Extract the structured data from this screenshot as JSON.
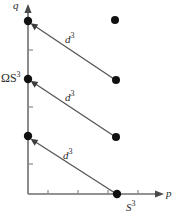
{
  "figure": {
    "axes": {
      "x_axis_label": "p",
      "y_axis_label": "q",
      "y_tick_label": "ΩS",
      "y_tick_label_sup": "3",
      "x_tick_label": "S",
      "x_tick_label_sup": "3",
      "x_axis_origin_px": [
        28,
        194
      ],
      "x_axis_end_px": [
        163,
        194
      ],
      "y_axis_end_px": [
        28,
        10
      ],
      "x_ticks_px": [
        48,
        78,
        108,
        138
      ],
      "y_ticks_px": [
        50,
        107,
        164
      ],
      "axis_color": "#6e6e6e",
      "text_color": "#2b2b2b"
    },
    "annotations": [
      {
        "label": "d",
        "sup": "3",
        "name": "arrow-label-d3-top"
      },
      {
        "label": "d",
        "sup": "3",
        "name": "arrow-label-d3-middle"
      },
      {
        "label": "d",
        "sup": "3",
        "name": "arrow-label-d3-bottom"
      }
    ],
    "points": [
      {
        "name": "point-y-axis-top",
        "x": 28,
        "y": 21,
        "on_axis": "y"
      },
      {
        "name": "point-y-axis-middle",
        "x": 28,
        "y": 79,
        "on_axis": "y"
      },
      {
        "name": "point-y-axis-bottom",
        "x": 28,
        "y": 136,
        "on_axis": "y"
      },
      {
        "name": "point-isolated-top-right",
        "x": 115,
        "y": 20,
        "on_axis": "none"
      },
      {
        "name": "point-arrow-start-top",
        "x": 116,
        "y": 80,
        "on_axis": "none"
      },
      {
        "name": "point-arrow-start-middle",
        "x": 116,
        "y": 137,
        "on_axis": "none"
      },
      {
        "name": "point-arrow-start-bottom",
        "x": 117,
        "y": 194,
        "on_axis": "x"
      }
    ],
    "arrows": [
      {
        "name": "arrow-d3-top",
        "from": [
          114,
          79
        ],
        "to": [
          31,
          23
        ]
      },
      {
        "name": "arrow-d3-middle",
        "from": [
          114,
          136
        ],
        "to": [
          31,
          81
        ]
      },
      {
        "name": "arrow-d3-bottom",
        "from": [
          115,
          193
        ],
        "to": [
          31,
          139
        ]
      }
    ],
    "point_color": "#111111",
    "arrow_color": "#555555"
  }
}
